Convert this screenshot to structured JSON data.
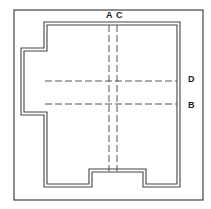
{
  "diagram": {
    "type": "floor-plan-section-markers",
    "colors": {
      "line": "#444444",
      "background": "#ffffff"
    },
    "frame": {
      "x": 14,
      "y": 10,
      "w": 189,
      "h": 190
    },
    "walls": {
      "outer_points": "44,22 180,22 180,187 143,187 143,172 92,172 92,187 44,187 44,115 21,115 21,48 44,48",
      "inner_points": "47,25 177,25 177,184 146,184 146,169 89,169 89,184 47,184 47,112 24,112 24,51 47,51"
    },
    "section_lines": [
      {
        "id": "A",
        "label": "A",
        "orientation": "vertical",
        "pos": 109,
        "from": 25,
        "to": 171,
        "label_x": 106,
        "label_y": 18
      },
      {
        "id": "C",
        "label": "C",
        "orientation": "vertical",
        "pos": 117,
        "from": 25,
        "to": 171,
        "label_x": 116,
        "label_y": 18
      },
      {
        "id": "D",
        "label": "D",
        "orientation": "horizontal",
        "pos": 81,
        "from": 45,
        "to": 177,
        "label_x": 188,
        "label_y": 82
      },
      {
        "id": "B",
        "label": "B",
        "orientation": "horizontal",
        "pos": 104,
        "from": 45,
        "to": 177,
        "label_x": 188,
        "label_y": 108
      }
    ]
  }
}
